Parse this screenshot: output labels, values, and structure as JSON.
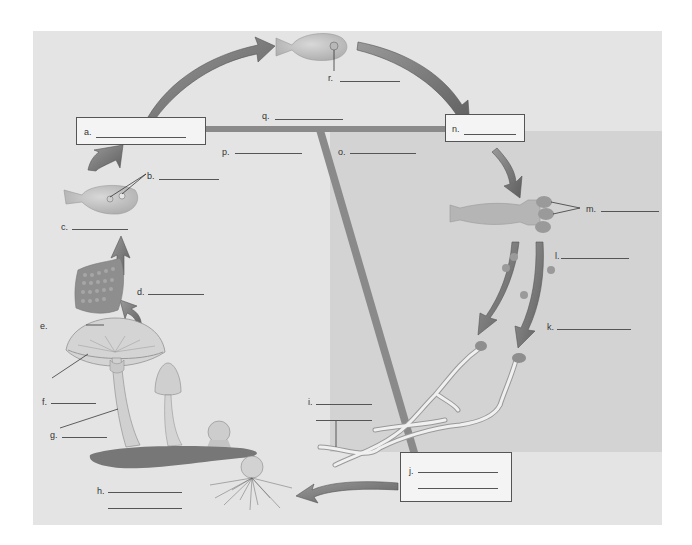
{
  "diagram": {
    "colors": {
      "panel_bg": "#e4e4e4",
      "shaded_region": "#d3d3d3",
      "arrow": "#6e6e6e",
      "box_bg": "#f4f4f4",
      "divider_bar": "#8a8a8a"
    },
    "labels": {
      "a": "a.",
      "b": "b.",
      "c": "c.",
      "d": "d.",
      "e": "e.",
      "f": "f.",
      "g": "g.",
      "h": "h.",
      "i": "i.",
      "j": "j.",
      "k": "k.",
      "l": "l.",
      "m": "m.",
      "n": "n.",
      "o": "o.",
      "p": "p.",
      "q": "q.",
      "r": "r."
    },
    "illustrations": [
      "zygote-cell",
      "basidium-with-nuclei",
      "gill-section-with-basidia",
      "mature-mushroom",
      "young-mushroom",
      "button-mushroom",
      "button-with-mycelium",
      "primary-hyphae",
      "basidiospores",
      "basidium-with-spores"
    ]
  }
}
